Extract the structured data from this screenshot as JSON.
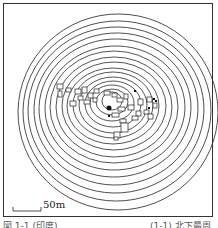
{
  "map": {
    "scale_bar": {
      "label": "50m"
    },
    "contour_count": 16,
    "center_marker": "filled-dot",
    "colors": {
      "line": "#2a2a2a",
      "background": "#ffffff"
    },
    "buildings_cluster": "rectangles-west-and-east-of-center"
  },
  "caption": {
    "left": "図 1-1 (印度)",
    "right": "(1-1) 北下最周"
  }
}
